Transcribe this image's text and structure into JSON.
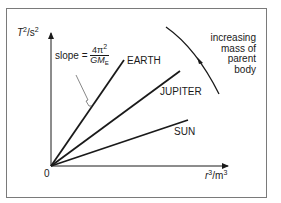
{
  "diagram": {
    "type": "line-graph-schematic",
    "y_axis": {
      "symbol": "T",
      "power": "2",
      "unit": "s",
      "unit_power": "2"
    },
    "x_axis": {
      "symbol": "r",
      "power": "3",
      "unit": "m",
      "unit_power": "3"
    },
    "origin_label": "0",
    "slope_label": {
      "text": "slope =",
      "numerator": "4π",
      "numerator_power": "2",
      "denominator": "GM",
      "denominator_sub": "E"
    },
    "lines": [
      {
        "label": "EARTH",
        "steepness": "steepest"
      },
      {
        "label": "JUPITER",
        "steepness": "middle"
      },
      {
        "label": "SUN",
        "steepness": "shallowest"
      }
    ],
    "annotation": {
      "lines": [
        "increasing",
        "mass of",
        "parent",
        "body"
      ]
    },
    "colors": {
      "ink": "#1a1a1a",
      "frame": "#7a7a7a",
      "background": "#ffffff"
    }
  }
}
